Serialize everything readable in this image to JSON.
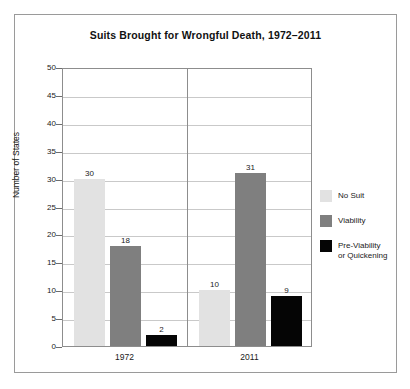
{
  "chart_data": {
    "type": "bar",
    "title": "Suits Brought for Wrongful Death, 1972–2011",
    "xlabel": "",
    "ylabel": "Number of States",
    "categories": [
      "1972",
      "2011"
    ],
    "ylim": [
      0,
      50
    ],
    "ytick_step": 5,
    "ytick_labels": [
      "50",
      "45",
      "40",
      "35",
      "30",
      "25",
      "20",
      "15",
      "10",
      "5",
      "0"
    ],
    "grid": true,
    "legend_position": "right",
    "series": [
      {
        "name": "No Suit",
        "legend_label": "No Suit",
        "color": "#e2e2e2",
        "values": [
          30,
          10
        ],
        "value_labels": [
          "30",
          "10"
        ]
      },
      {
        "name": "Viability",
        "legend_label": "Viability",
        "color": "#7f7f7f",
        "values": [
          18,
          31
        ],
        "value_labels": [
          "18",
          "31"
        ]
      },
      {
        "name": "Pre-Viability or Quickening",
        "legend_label": "Pre-Viability\nor Quickening",
        "color": "#050505",
        "values": [
          2,
          9
        ],
        "value_labels": [
          "2",
          "9"
        ]
      }
    ]
  },
  "figure": {
    "frame_color": "#9a9a9a",
    "plot_border_color": "#8d8d8d",
    "gridline_color": "#c9c9c9",
    "background": "#ffffff"
  }
}
